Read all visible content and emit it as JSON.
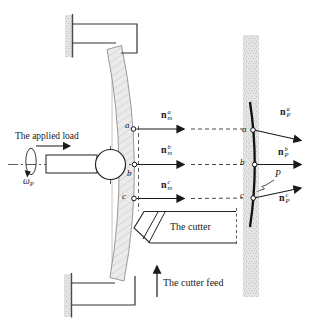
{
  "figure": {
    "texts": {
      "applied_load": "The applied load",
      "cutter": "The cutter",
      "cutter_feed": "The cutter feed"
    },
    "omega": {
      "base": "ω",
      "sub": "P"
    },
    "surface_label": "P",
    "points_left": [
      "a",
      "b",
      "c"
    ],
    "points_right": [
      "a",
      "b",
      "c"
    ],
    "vectors_left": [
      {
        "base": "n",
        "sub": "m",
        "sup": "a"
      },
      {
        "base": "n",
        "sub": "m",
        "sup": "b"
      },
      {
        "base": "n",
        "sub": "m",
        "sup": "c"
      }
    ],
    "vectors_right": [
      {
        "base": "n",
        "sub": "P",
        "sup": "a"
      },
      {
        "base": "n",
        "sub": "P",
        "sup": "b"
      },
      {
        "base": "n",
        "sub": "P",
        "sup": "c"
      }
    ],
    "colors": {
      "speckle_fill": "#e4e4e4",
      "speckle_dot": "#bcbcbc",
      "beam_fill": "#ebebeb",
      "beam_hatch": "#c6c6c6",
      "line": "#2b2b2b"
    }
  }
}
